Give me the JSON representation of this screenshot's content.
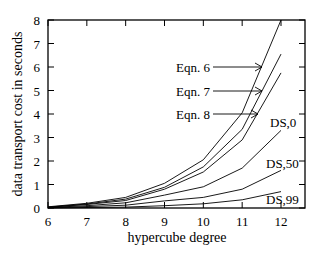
{
  "chart_data": {
    "type": "line",
    "title": "",
    "xlabel": "hypercube degree",
    "ylabel": "data transport cost in seconds",
    "xlim": [
      6,
      12.6
    ],
    "ylim": [
      0,
      8
    ],
    "x_ticks": [
      6,
      7,
      8,
      9,
      10,
      11,
      12
    ],
    "y_ticks": [
      0,
      1,
      2,
      3,
      4,
      5,
      6,
      7,
      8
    ],
    "grid": false,
    "x": [
      6,
      7,
      8,
      9,
      10,
      11,
      12
    ],
    "series": [
      {
        "name": "Eqn. 6",
        "values": [
          0.05,
          0.2,
          0.45,
          1.05,
          2.05,
          4.05,
          8.0
        ]
      },
      {
        "name": "Eqn. 7",
        "values": [
          0.04,
          0.17,
          0.38,
          0.88,
          1.75,
          3.35,
          6.55
        ]
      },
      {
        "name": "Eqn. 8",
        "values": [
          0.03,
          0.15,
          0.32,
          0.8,
          1.53,
          2.9,
          5.75
        ]
      },
      {
        "name": "DS,0",
        "values": [
          0.02,
          0.1,
          0.22,
          0.55,
          0.9,
          1.7,
          3.3
        ]
      },
      {
        "name": "DS,50",
        "values": [
          0.01,
          0.06,
          0.12,
          0.3,
          0.45,
          0.8,
          1.6
        ]
      },
      {
        "name": "DS,99",
        "values": [
          0.0,
          0.02,
          0.04,
          0.1,
          0.18,
          0.35,
          0.7
        ]
      }
    ],
    "annotations": [
      {
        "text": "Eqn. 6",
        "arrow_to_series": "Eqn. 6"
      },
      {
        "text": "Eqn. 7",
        "arrow_to_series": "Eqn. 7"
      },
      {
        "text": "Eqn. 8",
        "arrow_to_series": "Eqn. 8"
      },
      {
        "text": "DS,0"
      },
      {
        "text": "DS,50"
      },
      {
        "text": "DS,99"
      }
    ],
    "legend": "inline labels"
  },
  "labels": {
    "xlabel": "hypercube degree",
    "ylabel": "data transport cost in seconds",
    "eqn6": "Eqn. 6",
    "eqn7": "Eqn. 7",
    "eqn8": "Eqn. 8",
    "ds0": "DS,0",
    "ds50": "DS,50",
    "ds99": "DS,99"
  }
}
